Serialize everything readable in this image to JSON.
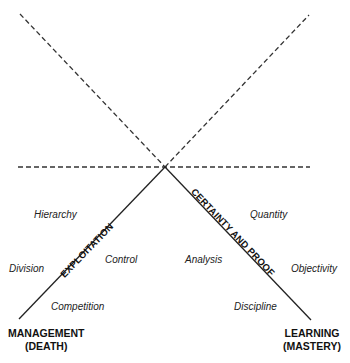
{
  "diagram": {
    "axes": {
      "left": "EXPLOITATION",
      "right": "CERTAINTY AND PROOF"
    },
    "corners": {
      "left_line1": "MANAGEMENT",
      "left_line2": "(DEATH)",
      "right_line1": "LEARNING",
      "right_line2": "(MASTERY)"
    },
    "terms": {
      "hierarchy": "Hierarchy",
      "division": "Division",
      "control": "Control",
      "competition": "Competition",
      "quantity": "Quantity",
      "analysis": "Analysis",
      "objectivity": "Objectivity",
      "discipline": "Discipline"
    }
  }
}
